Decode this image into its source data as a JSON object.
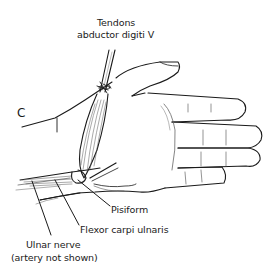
{
  "figure": {
    "panel_letter": "C",
    "labels": {
      "tendons_line1": "Tendons",
      "tendons_line2": "abductor digiti V",
      "pisiform": "Pisiform",
      "flexor": "Flexor carpi ulnaris",
      "ulnar_line1": "Ulnar nerve",
      "ulnar_line2": "(artery not shown)"
    },
    "colors": {
      "line": "#1a1a1a",
      "background": "#ffffff"
    }
  }
}
